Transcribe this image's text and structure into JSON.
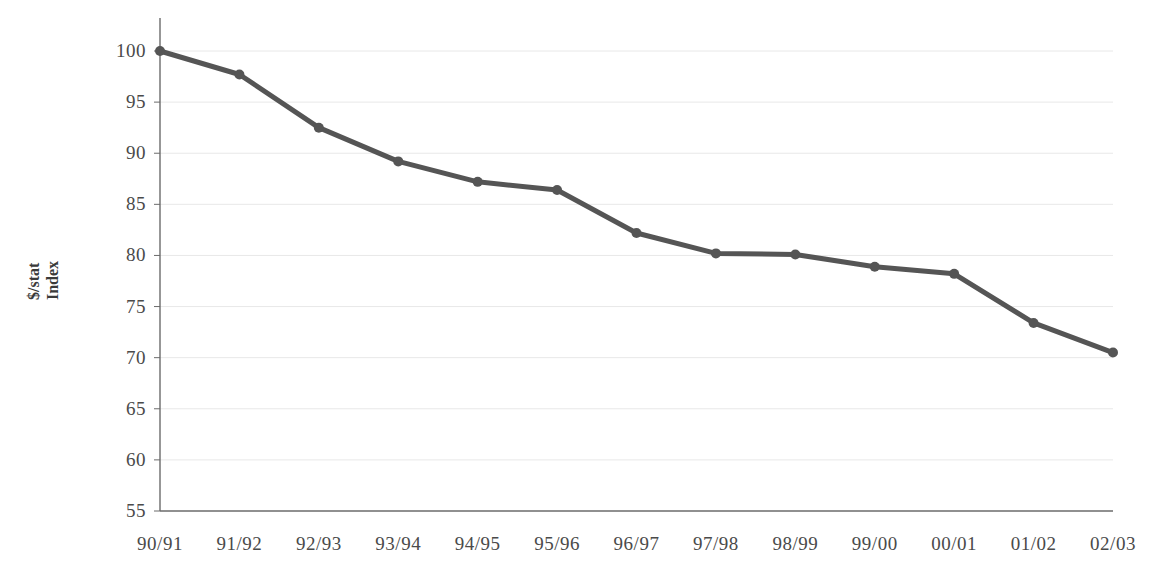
{
  "chart_data": {
    "type": "line",
    "title": "",
    "xlabel": "",
    "ylabel": "$/stat Index",
    "ylabel_lines": [
      "$/stat",
      "Index"
    ],
    "categories": [
      "90/91",
      "91/92",
      "92/93",
      "93/94",
      "94/95",
      "95/96",
      "96/97",
      "97/98",
      "98/99",
      "99/00",
      "00/01",
      "01/02",
      "02/03"
    ],
    "values": [
      100.0,
      97.7,
      92.5,
      89.2,
      87.2,
      86.4,
      82.2,
      80.2,
      80.1,
      78.9,
      78.2,
      73.4,
      70.5
    ],
    "ylim": [
      55,
      100
    ],
    "yticks": [
      55,
      60,
      65,
      70,
      75,
      80,
      85,
      90,
      95,
      100
    ],
    "ytick_labels": [
      "55",
      "60",
      "65",
      "70",
      "75",
      "80",
      "85",
      "90",
      "95",
      "100"
    ],
    "grid": "horizontal",
    "legend": "none",
    "series_color": "#555555",
    "gridline_color": "#e8e8e8",
    "axis_color": "#6b6b6b",
    "marker": "circle",
    "marker_size": 5,
    "line_width": 5
  }
}
